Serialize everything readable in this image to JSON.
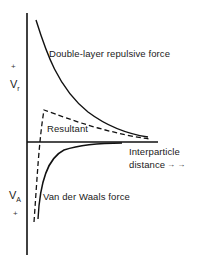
{
  "diagram": {
    "type": "potential-energy-curves",
    "axes": {
      "y_upper_label_main": "V",
      "y_upper_label_sub": "r",
      "y_upper_sign": "+",
      "y_lower_label_main": "V",
      "y_lower_label_sub": "A",
      "y_lower_sign": "+",
      "x_label_line1": "Interparticle",
      "x_label_line2": "distance",
      "x_arrow": "→ →"
    },
    "curves": [
      {
        "name": "double-layer-repulsive",
        "label": "Double-layer repulsive force",
        "style": "solid"
      },
      {
        "name": "resultant",
        "label": "Resultant",
        "style": "dashed"
      },
      {
        "name": "van-der-waals",
        "label": "Van der Waals force",
        "style": "solid"
      }
    ],
    "colors": {
      "line": "#111111",
      "background": "#ffffff"
    }
  }
}
